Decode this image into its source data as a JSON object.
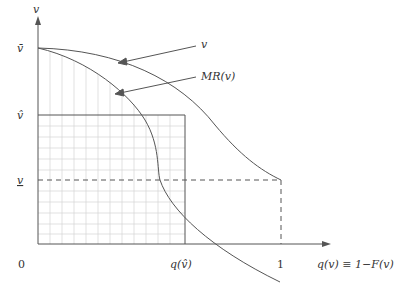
{
  "diagram": {
    "y_axis": {
      "label": "v",
      "ticks": [
        {
          "label": "v̄",
          "name": "v-bar",
          "y": 48
        },
        {
          "label": "v̂",
          "name": "v-hat",
          "y": 115
        },
        {
          "label": "v",
          "name": "v-underline",
          "y": 180
        }
      ]
    },
    "x_axis": {
      "label": "q(v) ≡ 1−F(v)",
      "origin": "0",
      "ticks": [
        {
          "label": "q(v̂)",
          "name": "q-v-hat",
          "x": 185
        },
        {
          "label": "1",
          "name": "one",
          "x": 281
        }
      ]
    },
    "curves": [
      {
        "name": "v",
        "label": "v"
      },
      {
        "name": "MR(v)",
        "label": "MR(v)"
      }
    ],
    "annotations": {
      "v_label": "v",
      "mr_label": "MR(v)"
    },
    "colors": {
      "line": "#555555",
      "grid": "#cfcfcf",
      "text": "#333333"
    }
  }
}
